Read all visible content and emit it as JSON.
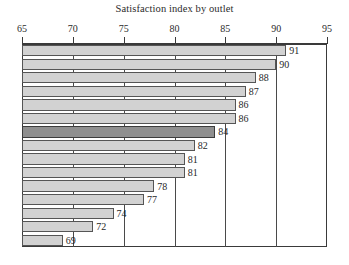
{
  "chart_data": {
    "type": "bar",
    "orientation": "horizontal",
    "title": "Satisfaction index by outlet",
    "xlabel": "",
    "ylabel": "",
    "xlim": [
      65,
      95
    ],
    "xticks": [
      65,
      70,
      75,
      80,
      85,
      90,
      95
    ],
    "xtick_labels": [
      "65",
      "70",
      "75",
      "80",
      "85",
      "90",
      "95"
    ],
    "axis_position": "top",
    "grid": "vertical",
    "legend": "none",
    "categories": [
      "outlet-1",
      "outlet-2",
      "outlet-3",
      "outlet-4",
      "outlet-5",
      "outlet-6",
      "outlet-7",
      "outlet-8",
      "outlet-9",
      "outlet-10",
      "outlet-11",
      "outlet-12",
      "outlet-13",
      "outlet-14",
      "outlet-15"
    ],
    "values": [
      91,
      90,
      88,
      87,
      86,
      86,
      84,
      82,
      81,
      81,
      78,
      77,
      74,
      72,
      69
    ],
    "data_labels": [
      "91",
      "90",
      "88",
      "87",
      "86",
      "86",
      "84",
      "82",
      "81",
      "81",
      "78",
      "77",
      "74",
      "72",
      "69"
    ],
    "highlighted_index": 6,
    "colors": {
      "bar_fill": "#d2d2d2",
      "bar_border": "#555555",
      "highlight_fill": "#8f8f8f",
      "highlight_border": "#3c3c3c",
      "axis": "#3a3a3a",
      "gridline": "#4a4a4a",
      "text": "#1f1f1f",
      "background": "#ffffff"
    }
  }
}
